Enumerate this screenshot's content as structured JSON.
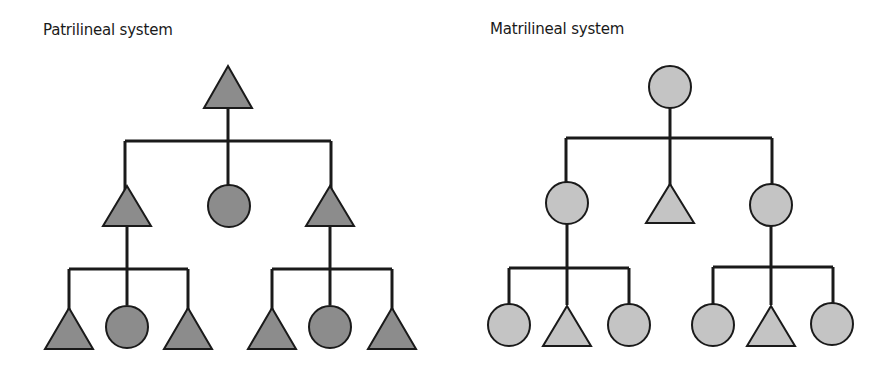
{
  "diagrams": [
    {
      "title": "Patrilineal system",
      "fill": "#8c8c8c",
      "generations": [
        [
          "male"
        ],
        [
          "male",
          "female",
          "male"
        ],
        [
          "male",
          "female",
          "male",
          "male",
          "female",
          "male"
        ]
      ]
    },
    {
      "title": "Matrilineal system",
      "fill": "#c4c4c4",
      "generations": [
        [
          "female"
        ],
        [
          "female",
          "male",
          "female"
        ],
        [
          "female",
          "male",
          "female",
          "female",
          "male",
          "female"
        ]
      ]
    }
  ],
  "legend_symbols": {
    "triangle": "male",
    "circle": "female"
  }
}
